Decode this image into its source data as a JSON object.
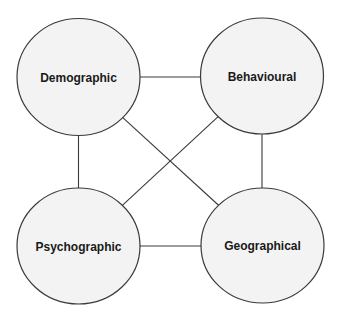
{
  "diagram": {
    "nodes": [
      {
        "id": "demographic",
        "label": "Demographic"
      },
      {
        "id": "behavioural",
        "label": "Behavioural"
      },
      {
        "id": "psychographic",
        "label": "Psychographic"
      },
      {
        "id": "geographical",
        "label": "Geographical"
      }
    ],
    "edges": [
      {
        "from": "demographic",
        "to": "behavioural"
      },
      {
        "from": "demographic",
        "to": "psychographic"
      },
      {
        "from": "demographic",
        "to": "geographical"
      },
      {
        "from": "behavioural",
        "to": "psychographic"
      },
      {
        "from": "behavioural",
        "to": "geographical"
      },
      {
        "from": "psychographic",
        "to": "geographical"
      }
    ],
    "colors": {
      "node_fill": "#f3f3f3",
      "stroke": "#3a3a3a",
      "text": "#1a1a1a"
    }
  }
}
